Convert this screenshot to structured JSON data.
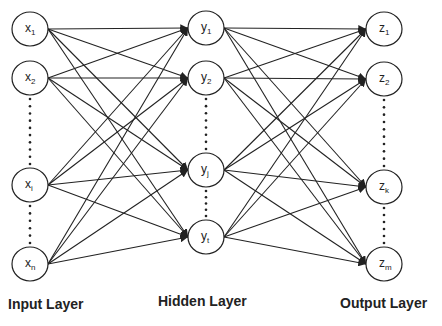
{
  "diagram": {
    "type": "fully-connected neural network",
    "layers": [
      {
        "id": "input",
        "label": "Input Layer",
        "nodes": [
          {
            "id": "x1",
            "base": "x",
            "sub": "1"
          },
          {
            "id": "x2",
            "base": "x",
            "sub": "2"
          },
          {
            "id": "xi",
            "base": "x",
            "sub": "i"
          },
          {
            "id": "xn",
            "base": "x",
            "sub": "n"
          }
        ],
        "ellipsis_after": [
          1,
          2
        ]
      },
      {
        "id": "hidden",
        "label": "Hidden Layer",
        "nodes": [
          {
            "id": "y1",
            "base": "y",
            "sub": "1"
          },
          {
            "id": "y2",
            "base": "y",
            "sub": "2"
          },
          {
            "id": "yj",
            "base": "y",
            "sub": "j"
          },
          {
            "id": "yt",
            "base": "y",
            "sub": "t"
          }
        ],
        "ellipsis_after": [
          1,
          2
        ]
      },
      {
        "id": "output",
        "label": "Output Layer",
        "nodes": [
          {
            "id": "z1",
            "base": "z",
            "sub": "1"
          },
          {
            "id": "z2",
            "base": "z",
            "sub": "2"
          },
          {
            "id": "zk",
            "base": "z",
            "sub": "k"
          },
          {
            "id": "zm",
            "base": "z",
            "sub": "m"
          }
        ],
        "ellipsis_after": [
          1,
          2
        ]
      }
    ],
    "connections": "every node connects to every node of the next layer, arrow pointing forward",
    "colors": {
      "stroke": "#222222",
      "background": "#ffffff"
    }
  }
}
